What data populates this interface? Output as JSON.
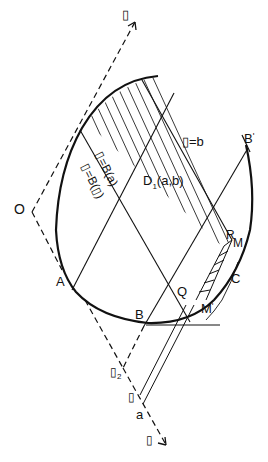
{
  "figure": {
    "stroke_color": "#111111",
    "background": "#ffffff"
  },
  "labels": {
    "top_axis": "▯",
    "origin": "O",
    "point_A": "A",
    "point_B": "B",
    "point_B_prime": "B",
    "point_B_prime_mark": "'",
    "point_Q": "Q",
    "point_M_prime": "M",
    "point_M_prime_mark": "'",
    "point_C": "C",
    "point_R": "R",
    "point_M": "M",
    "line_eq_b": "▯=b",
    "line_eq_Ba": "▯=B(a)",
    "line_eq_B0": "▯=B(▯)",
    "region": "D",
    "region_sub": "1",
    "region_args": "(a,b)",
    "lower_point": "▯",
    "lower_point_sub": "2",
    "small_point": "▯",
    "point_a": "a",
    "bottom_axis": "▯"
  }
}
